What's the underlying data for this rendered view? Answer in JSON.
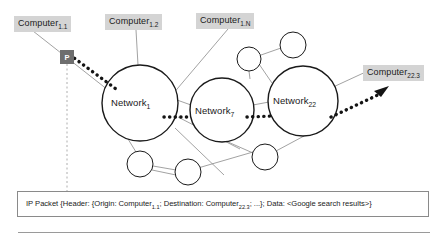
{
  "figure": {
    "title_semantic": "ip-packet-routing-network-diagram",
    "background": "#ffffff",
    "host_label_bg": "#d4d4d4",
    "packet_marker_bg": "#6e6e6e",
    "line_color": "#8a8a8a",
    "node_stroke": "#1a1a1a"
  },
  "hosts": [
    {
      "id": "computer-1-1",
      "name": "Computer",
      "sub": "1.1",
      "x": 14,
      "y": 16
    },
    {
      "id": "computer-1-2",
      "name": "Computer",
      "sub": "1.2",
      "x": 105,
      "y": 14
    },
    {
      "id": "computer-1-n",
      "name": "Computer",
      "sub": "1.N",
      "x": 196,
      "y": 13
    },
    {
      "id": "computer-22-3",
      "name": "Computer",
      "sub": "22.3",
      "x": 363,
      "y": 65
    }
  ],
  "networks": [
    {
      "id": "network-1",
      "name": "Network",
      "sub": "1",
      "cx": 140,
      "cy": 103,
      "r": 38
    },
    {
      "id": "network-7",
      "name": "Network",
      "sub": "7",
      "cx": 222,
      "cy": 110,
      "r": 32
    },
    {
      "id": "network-22",
      "name": "Network",
      "sub": "22",
      "cx": 303,
      "cy": 101,
      "r": 35
    }
  ],
  "routers": [
    {
      "id": "router-top-a",
      "cx": 249,
      "cy": 59,
      "r": 12
    },
    {
      "id": "router-top-b",
      "cx": 293,
      "cy": 45,
      "r": 13
    },
    {
      "id": "router-bot-a",
      "cx": 140,
      "cy": 164,
      "r": 13
    },
    {
      "id": "router-bot-b",
      "cx": 188,
      "cy": 172,
      "r": 13
    },
    {
      "id": "router-bot-c",
      "cx": 265,
      "cy": 157,
      "r": 13
    }
  ],
  "packet_marker": {
    "label": "P",
    "x": 60,
    "y": 50,
    "size": 14
  },
  "caption": {
    "prefix": "IP Packet {Header: {Origin: Computer",
    "origin_sub": "1.1",
    "mid": "; Destination: Computer",
    "destination_sub": "22.3",
    "suffix": "; ...}; Data: <Google search results>}",
    "full": "IP Packet {Header: {Origin: Computer1.1; Destination: Computer22.3; ...}; Data: <Google search results>}"
  },
  "paths": {
    "packet_route_description": "Dotted thick route from Computer 1.1 through Network 1, Network 7, Network 22 to Computer 22.3",
    "arrow_target": "computer-22-3"
  }
}
